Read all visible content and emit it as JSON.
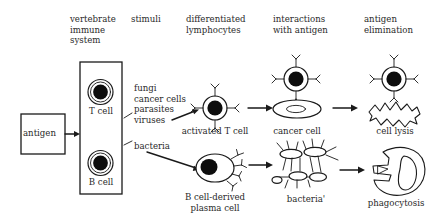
{
  "figure": {
    "background_color": "#ffffff",
    "ink_color": "#1a1a1a"
  },
  "columns": [
    {
      "id": "col-immune-system",
      "label": "vertebrate\nimmune\nsystem"
    },
    {
      "id": "col-stimuli",
      "label": "stimuli"
    },
    {
      "id": "col-differentiated-lymphocytes",
      "label": "differentiated\nlymphocytes"
    },
    {
      "id": "col-interactions-with-antigen",
      "label": "interactions\nwith antigen"
    },
    {
      "id": "col-antigen-elimination",
      "label": "antigen\nelimination"
    }
  ],
  "nodes": {
    "antigen": {
      "label": "antigen"
    },
    "t_cell": {
      "label": "T cell"
    },
    "b_cell": {
      "label": "B cell"
    },
    "activated_t_cell": {
      "label": "activated T cell"
    },
    "plasma_cell": {
      "label": "B cell-derived\nplasma cell"
    },
    "cancer_cell": {
      "label": "cancer cell"
    },
    "bacteria_prime": {
      "label": "bacteria'"
    },
    "cell_lysis": {
      "label": "cell lysis"
    },
    "phagocytosis": {
      "label": "phagocytosis"
    }
  },
  "stimuli": {
    "t_cell_branch": {
      "items": [
        "fungi",
        "cancer cells",
        "parasites",
        "viruses"
      ],
      "text": "fungi\ncancer cells\nparasites\nviruses"
    },
    "b_cell_branch": {
      "items": [
        "bacteria"
      ],
      "text": "bacteria"
    }
  },
  "pathways": [
    {
      "name": "cell-mediated-immunity",
      "steps": [
        "T cell",
        "activated T cell",
        "cancer cell",
        "cell lysis"
      ]
    },
    {
      "name": "humoral-immunity",
      "steps": [
        "B cell",
        "B cell-derived plasma cell",
        "bacteria'",
        "phagocytosis"
      ]
    }
  ]
}
